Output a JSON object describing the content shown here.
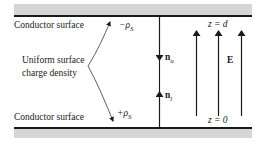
{
  "diagram": {
    "top_plate": {
      "label": "Conductor surface",
      "charge": "−ρS",
      "position": "z = d"
    },
    "bottom_plate": {
      "label": "Conductor surface",
      "charge": "+ρS",
      "position": "z = 0"
    },
    "annotation": {
      "line1": "Uniform surface",
      "line2": "charge density"
    },
    "normals": {
      "upper": "nu",
      "lower": "nl"
    },
    "field": {
      "label": "E",
      "arrow_count": 3,
      "direction": "up"
    },
    "colors": {
      "line": "#1a1a1a",
      "band": "#d6d6d6",
      "background": "#ffffff"
    }
  },
  "text": {
    "top_conductor": "Conductor surface",
    "bottom_conductor": "Conductor surface",
    "minus_rho": "−ρ",
    "plus_rho": "+ρ",
    "sub_s": "S",
    "annot_1": "Uniform surface",
    "annot_2": "charge density",
    "n": "n",
    "sub_u": "u",
    "sub_l": "l",
    "z_d": "z = d",
    "z_0": "z = 0",
    "E": "E"
  }
}
